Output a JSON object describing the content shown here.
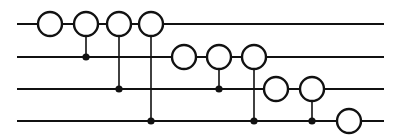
{
  "diagram": {
    "type": "controlled-rotation circuit",
    "num_wires": 4,
    "wires": [
      {
        "index": 0,
        "label": ""
      },
      {
        "index": 1,
        "label": ""
      },
      {
        "index": 2,
        "label": ""
      },
      {
        "index": 3,
        "label": ""
      }
    ],
    "gates": [
      {
        "step": 0,
        "target": 0,
        "control": null
      },
      {
        "step": 1,
        "target": 0,
        "control": 1
      },
      {
        "step": 2,
        "target": 0,
        "control": 2
      },
      {
        "step": 3,
        "target": 0,
        "control": 3
      },
      {
        "step": 4,
        "target": 1,
        "control": null
      },
      {
        "step": 5,
        "target": 1,
        "control": 2
      },
      {
        "step": 6,
        "target": 1,
        "control": 3
      },
      {
        "step": 7,
        "target": 2,
        "control": null
      },
      {
        "step": 8,
        "target": 2,
        "control": 3
      },
      {
        "step": 9,
        "target": 3,
        "control": null
      }
    ],
    "colors": {
      "stroke": "#111111",
      "gate_fill": "#ffffff",
      "background": "#ffffff"
    }
  }
}
